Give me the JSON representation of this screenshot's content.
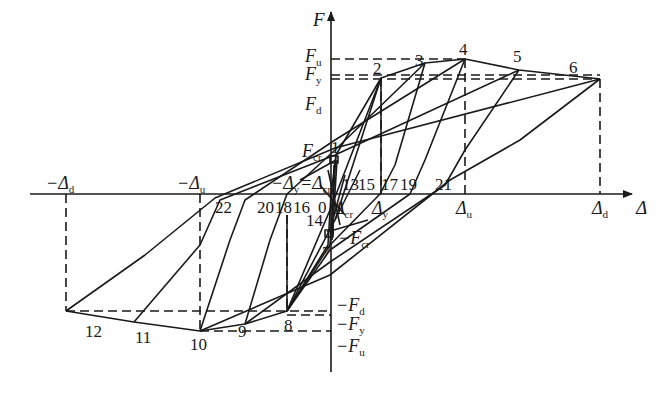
{
  "diagram": {
    "type": "hysteresis force-displacement skeleton",
    "axes": {
      "y_label": "F",
      "x_label": "Δ"
    },
    "force_levels": [
      {
        "id": "Fu",
        "main": "F",
        "sub": "u"
      },
      {
        "id": "Fy",
        "main": "F",
        "sub": "y"
      },
      {
        "id": "Fd",
        "main": "F",
        "sub": "d"
      },
      {
        "id": "Fcr",
        "main": "F",
        "sub": "cr"
      },
      {
        "id": "nFcr",
        "main": "−F",
        "sub": "cr"
      },
      {
        "id": "nFd",
        "main": "−F",
        "sub": "d"
      },
      {
        "id": "nFy",
        "main": "−F",
        "sub": "y"
      },
      {
        "id": "nFu",
        "main": "−F",
        "sub": "u"
      }
    ],
    "displacement_levels": [
      {
        "id": "nDd",
        "main": "−Δ",
        "sub": "d"
      },
      {
        "id": "nDu",
        "main": "−Δ",
        "sub": "u"
      },
      {
        "id": "nDy",
        "main": "−Δ",
        "sub": "y"
      },
      {
        "id": "nDcr",
        "main": "=Δ",
        "sub": "cr"
      },
      {
        "id": "Dcr",
        "main": "Δ",
        "sub": "cr"
      },
      {
        "id": "Dy",
        "main": "Δ",
        "sub": "y"
      },
      {
        "id": "Du",
        "main": "Δ",
        "sub": "u"
      },
      {
        "id": "Dd",
        "main": "Δ",
        "sub": "d"
      }
    ],
    "point_labels": [
      "0",
      "1",
      "2",
      "3",
      "4",
      "5",
      "6",
      "7",
      "8",
      "9",
      "10",
      "11",
      "12",
      "13",
      "14",
      "15",
      "16",
      "17",
      "18",
      "19",
      "20",
      "21",
      "22"
    ],
    "origin_label": "0"
  }
}
